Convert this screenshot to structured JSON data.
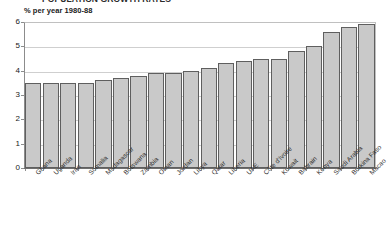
{
  "page": {
    "clipped_headline": "POPULATION GROWTH RATES"
  },
  "chart": {
    "axis_unit_label": "% per year 1980-88",
    "bar_fill_color": "#c9c9c9",
    "bar_border_color": "#5f5f5f",
    "gridline_color": "#cfcfcf"
  },
  "chart_data": {
    "type": "bar",
    "title": "",
    "subtitle": "",
    "xlabel": "",
    "ylabel": "% per year 1980-88",
    "ylim": [
      0,
      6
    ],
    "yticks": [
      0,
      1,
      2,
      3,
      4,
      5,
      6
    ],
    "ytick_labels": [
      "0",
      "1",
      "2",
      "3",
      "4",
      "5",
      "6"
    ],
    "grid": true,
    "legend": false,
    "legend_position": "none",
    "categories": [
      "Ghana",
      "Uganda",
      "Iran",
      "Somalia",
      "Madagascar",
      "Botswana",
      "Zambia",
      "Oman",
      "Jordan",
      "Libya",
      "Qatar",
      "Liberia",
      "UAE",
      "Côte d'Ivoire",
      "Kuwait",
      "Bahrain",
      "Kenya",
      "Saudi Arabia",
      "Burkina Faso",
      "Macao"
    ],
    "values": [
      3.5,
      3.5,
      3.5,
      3.5,
      3.6,
      3.7,
      3.8,
      3.9,
      3.9,
      4.0,
      4.1,
      4.3,
      4.4,
      4.5,
      4.5,
      4.8,
      5.0,
      5.6,
      5.8,
      5.9
    ]
  }
}
